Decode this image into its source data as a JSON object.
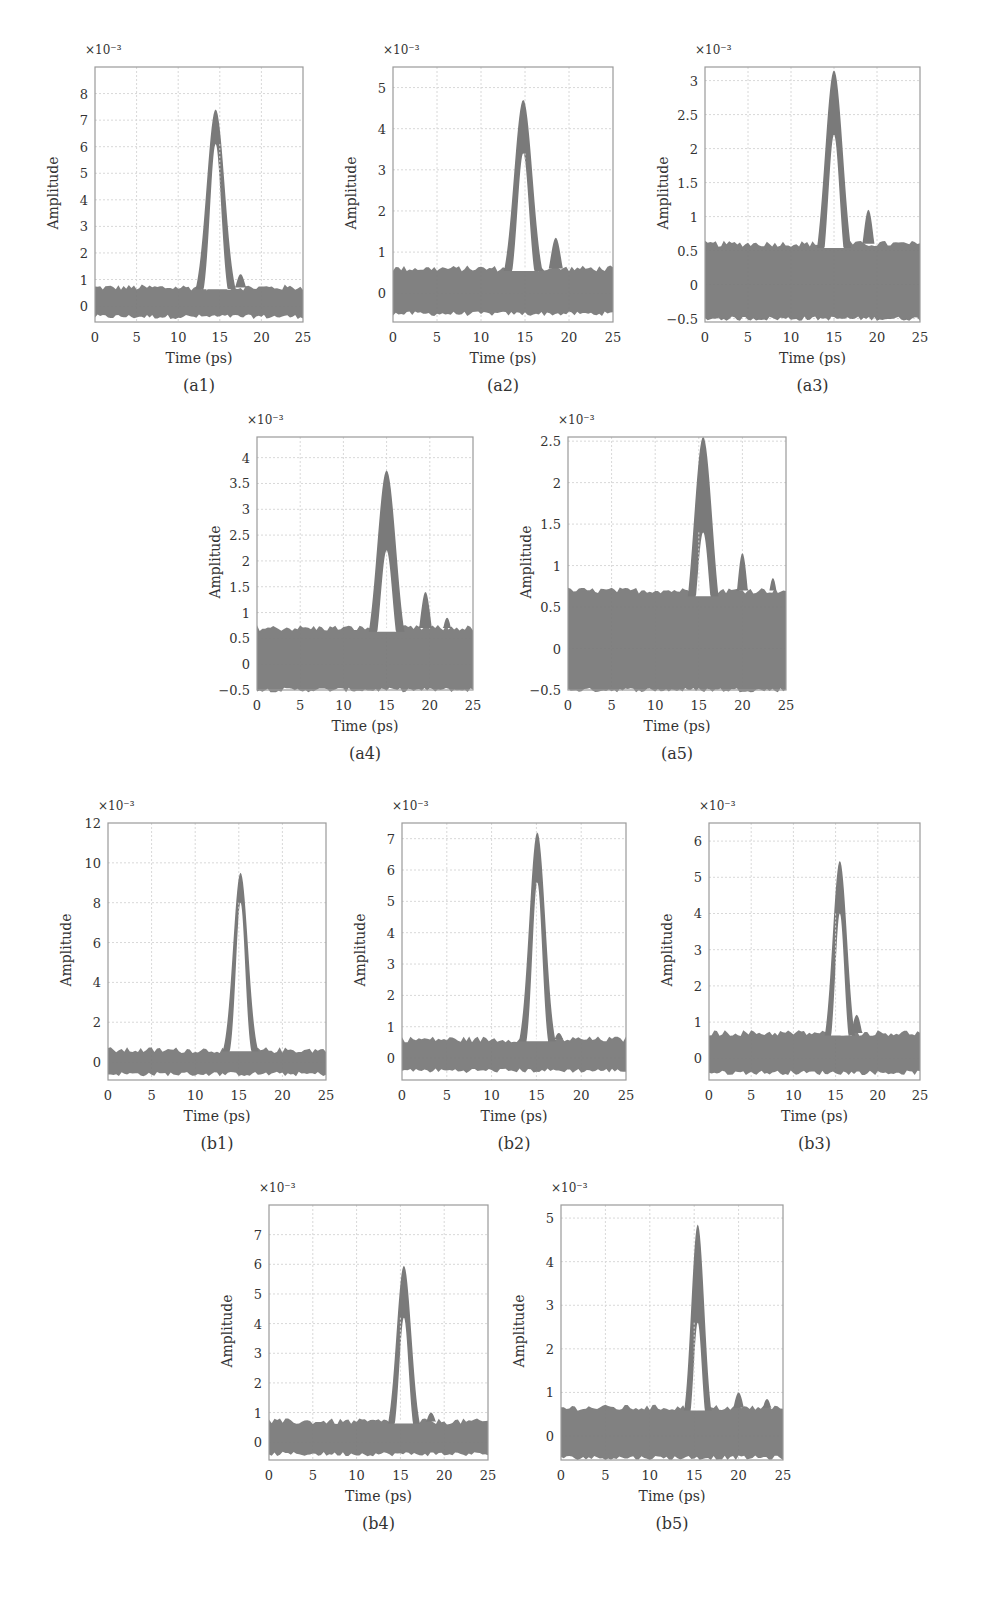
{
  "figure": {
    "trace_color": "#7a7a7a",
    "grid_color": "#d8d8d8",
    "frame_color": "#9a9a9a",
    "exponent_label": "×10⁻³",
    "xlabel": "Time (ps)",
    "ylabel": "Amplitude"
  },
  "chart_data": [
    {
      "id": "a1",
      "caption": "(a1)",
      "type": "line",
      "title": "",
      "xlabel": "Time (ps)",
      "ylabel": "Amplitude",
      "y_scale": "×10^-3",
      "xlim": [
        0,
        25
      ],
      "ylim": [
        -0.6,
        9
      ],
      "xticks": [
        0,
        5,
        10,
        15,
        20,
        25
      ],
      "yticks": [
        0,
        1,
        2,
        3,
        4,
        5,
        6,
        7,
        8
      ],
      "grid": true,
      "noise_band": [
        -0.4,
        0.7
      ],
      "peak": {
        "center": 14.5,
        "max": 7.4,
        "inner_max": 6.1,
        "halfwidth": 2.8
      },
      "secondary_peaks": [
        {
          "center": 17.5,
          "max": 1.2
        }
      ],
      "box": [
        95,
        67,
        303,
        322
      ]
    },
    {
      "id": "a2",
      "caption": "(a2)",
      "type": "line",
      "title": "",
      "xlabel": "Time (ps)",
      "ylabel": "Amplitude",
      "y_scale": "×10^-3",
      "xlim": [
        0,
        25
      ],
      "ylim": [
        -0.7,
        5.5
      ],
      "xticks": [
        0,
        5,
        10,
        15,
        20,
        25
      ],
      "yticks": [
        0,
        1,
        2,
        3,
        4,
        5
      ],
      "grid": true,
      "noise_band": [
        -0.5,
        0.6
      ],
      "peak": {
        "center": 14.8,
        "max": 4.7,
        "inner_max": 3.4,
        "halfwidth": 2.7
      },
      "secondary_peaks": [
        {
          "center": 18.5,
          "max": 1.35
        }
      ],
      "box": [
        393,
        67,
        613,
        322
      ]
    },
    {
      "id": "a3",
      "caption": "(a3)",
      "type": "line",
      "title": "",
      "xlabel": "Time (ps)",
      "ylabel": "Amplitude",
      "y_scale": "×10^-3",
      "xlim": [
        0,
        25
      ],
      "ylim": [
        -0.55,
        3.2
      ],
      "xticks": [
        0,
        5,
        10,
        15,
        20,
        25
      ],
      "yticks": [
        -0.5,
        0,
        0.5,
        1,
        1.5,
        2,
        2.5,
        3
      ],
      "grid": true,
      "noise_band": [
        -0.5,
        0.6
      ],
      "peak": {
        "center": 15,
        "max": 3.15,
        "inner_max": 2.2,
        "halfwidth": 2.7
      },
      "secondary_peaks": [
        {
          "center": 19,
          "max": 1.1
        }
      ],
      "box": [
        705,
        67,
        920,
        322
      ]
    },
    {
      "id": "a4",
      "caption": "(a4)",
      "type": "line",
      "title": "",
      "xlabel": "Time (ps)",
      "ylabel": "Amplitude",
      "y_scale": "×10^-3",
      "xlim": [
        0,
        25
      ],
      "ylim": [
        -0.5,
        4.4
      ],
      "xticks": [
        0,
        5,
        10,
        15,
        20,
        25
      ],
      "yticks": [
        -0.5,
        0,
        0.5,
        1,
        1.5,
        2,
        2.5,
        3,
        3.5,
        4
      ],
      "grid": true,
      "noise_band": [
        -0.5,
        0.7
      ],
      "peak": {
        "center": 15,
        "max": 3.75,
        "inner_max": 2.2,
        "halfwidth": 2.8
      },
      "secondary_peaks": [
        {
          "center": 19.5,
          "max": 1.4
        },
        {
          "center": 22,
          "max": 0.9
        }
      ],
      "box": [
        257,
        437,
        473,
        690
      ]
    },
    {
      "id": "a5",
      "caption": "(a5)",
      "type": "line",
      "title": "",
      "xlabel": "Time (ps)",
      "ylabel": "Amplitude",
      "y_scale": "×10^-3",
      "xlim": [
        0,
        25
      ],
      "ylim": [
        -0.5,
        2.55
      ],
      "xticks": [
        0,
        5,
        10,
        15,
        20,
        25
      ],
      "yticks": [
        -0.5,
        0,
        0.5,
        1,
        1.5,
        2,
        2.5
      ],
      "grid": true,
      "noise_band": [
        -0.5,
        0.7
      ],
      "peak": {
        "center": 15.5,
        "max": 2.55,
        "inner_max": 1.4,
        "halfwidth": 2.7
      },
      "secondary_peaks": [
        {
          "center": 20,
          "max": 1.15
        },
        {
          "center": 23.5,
          "max": 0.85
        }
      ],
      "box": [
        568,
        437,
        786,
        690
      ]
    },
    {
      "id": "b1",
      "caption": "(b1)",
      "type": "line",
      "title": "",
      "xlabel": "Time (ps)",
      "ylabel": "Amplitude",
      "y_scale": "×10^-3",
      "xlim": [
        0,
        25
      ],
      "ylim": [
        -0.9,
        12
      ],
      "xticks": [
        0,
        5,
        10,
        15,
        20,
        25
      ],
      "yticks": [
        0,
        2,
        4,
        6,
        8,
        10,
        12
      ],
      "grid": true,
      "noise_band": [
        -0.6,
        0.6
      ],
      "peak": {
        "center": 15.2,
        "max": 9.5,
        "inner_max": 8.0,
        "halfwidth": 2.2
      },
      "secondary_peaks": [],
      "box": [
        108,
        823,
        326,
        1080
      ]
    },
    {
      "id": "b2",
      "caption": "(b2)",
      "type": "line",
      "title": "",
      "xlabel": "Time (ps)",
      "ylabel": "Amplitude",
      "y_scale": "×10^-3",
      "xlim": [
        0,
        25
      ],
      "ylim": [
        -0.7,
        7.5
      ],
      "xticks": [
        0,
        5,
        10,
        15,
        20,
        25
      ],
      "yticks": [
        0,
        1,
        2,
        3,
        4,
        5,
        6,
        7
      ],
      "grid": true,
      "noise_band": [
        -0.4,
        0.6
      ],
      "peak": {
        "center": 15.1,
        "max": 7.2,
        "inner_max": 5.6,
        "halfwidth": 2.3
      },
      "secondary_peaks": [
        {
          "center": 17.5,
          "max": 0.8
        }
      ],
      "box": [
        402,
        823,
        626,
        1080
      ]
    },
    {
      "id": "b3",
      "caption": "(b3)",
      "type": "line",
      "title": "",
      "xlabel": "Time (ps)",
      "ylabel": "Amplitude",
      "y_scale": "×10^-3",
      "xlim": [
        0,
        25
      ],
      "ylim": [
        -0.6,
        6.5
      ],
      "xticks": [
        0,
        5,
        10,
        15,
        20,
        25
      ],
      "yticks": [
        0,
        1,
        2,
        3,
        4,
        5,
        6
      ],
      "grid": true,
      "noise_band": [
        -0.4,
        0.7
      ],
      "peak": {
        "center": 15.5,
        "max": 5.45,
        "inner_max": 4.0,
        "halfwidth": 2.2
      },
      "secondary_peaks": [
        {
          "center": 17.5,
          "max": 1.2
        }
      ],
      "box": [
        709,
        823,
        920,
        1080
      ]
    },
    {
      "id": "b4",
      "caption": "(b4)",
      "type": "line",
      "title": "",
      "xlabel": "Time (ps)",
      "ylabel": "Amplitude",
      "y_scale": "×10^-3",
      "xlim": [
        0,
        25
      ],
      "ylim": [
        -0.6,
        8
      ],
      "xticks": [
        0,
        5,
        10,
        15,
        20,
        25
      ],
      "yticks": [
        0,
        1,
        2,
        3,
        4,
        5,
        6,
        7
      ],
      "grid": true,
      "noise_band": [
        -0.4,
        0.7
      ],
      "peak": {
        "center": 15.4,
        "max": 5.95,
        "inner_max": 4.2,
        "halfwidth": 2.2
      },
      "secondary_peaks": [
        {
          "center": 18.5,
          "max": 1.0
        }
      ],
      "box": [
        269,
        1205,
        488,
        1460
      ]
    },
    {
      "id": "b5",
      "caption": "(b5)",
      "type": "line",
      "title": "",
      "xlabel": "Time (ps)",
      "ylabel": "Amplitude",
      "y_scale": "×10^-3",
      "xlim": [
        0,
        25
      ],
      "ylim": [
        -0.55,
        5.3
      ],
      "xticks": [
        0,
        5,
        10,
        15,
        20,
        25
      ],
      "yticks": [
        0,
        1,
        2,
        3,
        4,
        5
      ],
      "grid": true,
      "noise_band": [
        -0.5,
        0.65
      ],
      "peak": {
        "center": 15.4,
        "max": 4.85,
        "inner_max": 2.6,
        "halfwidth": 1.9
      },
      "secondary_peaks": [
        {
          "center": 20,
          "max": 1.0
        },
        {
          "center": 23.2,
          "max": 0.85
        }
      ],
      "box": [
        561,
        1205,
        783,
        1460
      ]
    }
  ]
}
